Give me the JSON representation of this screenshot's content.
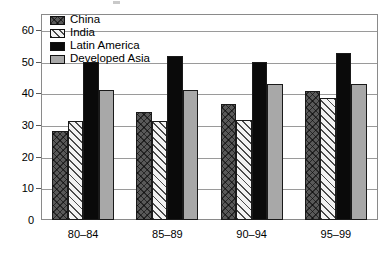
{
  "chart_data": {
    "type": "bar",
    "title": "",
    "subtitle": "",
    "xlabel": "",
    "ylabel": "",
    "categories": [
      "80–84",
      "85–89",
      "90–94",
      "95–99"
    ],
    "ylim": [
      0,
      65
    ],
    "yticks": [
      0,
      10,
      20,
      30,
      40,
      50,
      60
    ],
    "ytick_labels": [
      "0",
      "10",
      "20",
      "30",
      "40",
      "50",
      "60"
    ],
    "grid": true,
    "grid_axis": "y",
    "legend_position": "top-left-inside",
    "series": [
      {
        "name": "China",
        "pattern": "cross-hatch",
        "color": "#595959",
        "values": [
          28,
          34,
          36.5,
          40.8
        ]
      },
      {
        "name": "India",
        "pattern": "diagonal-hatch",
        "color": "#f2f2f2",
        "values": [
          31.4,
          31.4,
          31.5,
          38.4
        ]
      },
      {
        "name": "Latin America",
        "pattern": "solid",
        "color": "#0a0a0a",
        "values": [
          49.8,
          51.8,
          50.0,
          52.8
        ]
      },
      {
        "name": "Developed Asia",
        "pattern": "solid",
        "color": "#a8a8a8",
        "values": [
          41.0,
          41.0,
          43.0,
          43.0
        ]
      }
    ]
  },
  "legend": {
    "items": [
      {
        "label": "China"
      },
      {
        "label": "India"
      },
      {
        "label": "Latin America"
      },
      {
        "label": "Developed Asia"
      }
    ]
  }
}
